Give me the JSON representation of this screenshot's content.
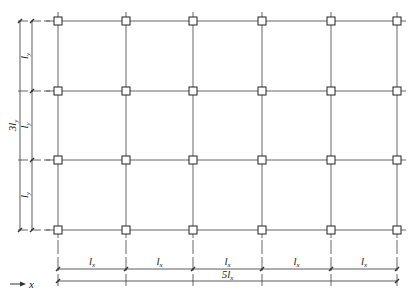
{
  "grid": {
    "columns_x": [
      58,
      126,
      193,
      262,
      331,
      397
    ],
    "rows_y": [
      21,
      91,
      160,
      230
    ],
    "line_color": "#555555",
    "column_marker": "square"
  },
  "dimensions": {
    "x_spans": [
      "l_x",
      "l_x",
      "l_x",
      "l_x",
      "l_x"
    ],
    "x_span_label": "lx",
    "x_total_label": "5lx",
    "y_spans": [
      "l_y",
      "l_y",
      "l_y"
    ],
    "y_span_label": "ly",
    "y_total_label": "3ly"
  },
  "axis": {
    "x_arrow_label": "x"
  }
}
